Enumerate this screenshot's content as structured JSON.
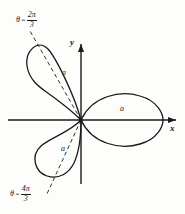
{
  "figure": {
    "axes": {
      "x_label": "x",
      "y_label": "y"
    },
    "petal_labels": [
      {
        "text": "a",
        "petal": "upper-left"
      },
      {
        "text": "a",
        "petal": "right"
      },
      {
        "text": "a",
        "petal": "lower-left"
      }
    ],
    "angle_labels": [
      {
        "theta_symbol": "θ",
        "equals": "=",
        "numerator": "2π",
        "denominator": "3",
        "position": "top-left"
      },
      {
        "theta_symbol": "θ",
        "equals": "=",
        "numerator": "4π",
        "denominator": "3",
        "position": "bottom-left"
      }
    ],
    "colors": {
      "ink": "#1a1a1a",
      "paper": "#fdfdfb"
    }
  }
}
